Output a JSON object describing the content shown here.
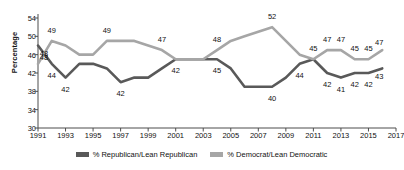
{
  "chart_data": {
    "type": "line",
    "title": "",
    "xlabel": "",
    "ylabel": "Percentage",
    "ylim": [
      30,
      54
    ],
    "yticks": [
      30,
      34,
      38,
      42,
      46,
      50,
      54
    ],
    "xlim": [
      1991,
      2017
    ],
    "xticks": [
      1991,
      1993,
      1995,
      1997,
      1999,
      2001,
      2003,
      2005,
      2007,
      2009,
      2011,
      2013,
      2015,
      2017
    ],
    "grid": false,
    "legend_position": "bottom",
    "x": [
      1991,
      1992,
      1993,
      1994,
      1995,
      1996,
      1997,
      1998,
      1999,
      2000,
      2001,
      2002,
      2003,
      2004,
      2005,
      2006,
      2007,
      2008,
      2009,
      2010,
      2011,
      2012,
      2013,
      2014,
      2015,
      2016
    ],
    "series": [
      {
        "name": "% Republican/Lean Republican",
        "color": "#595959",
        "values": [
          48,
          44,
          41,
          44,
          44,
          43,
          40,
          41,
          41,
          43,
          45,
          45,
          45,
          45,
          43,
          39,
          39,
          39,
          41,
          44,
          45,
          42,
          41,
          42,
          42,
          43
        ],
        "labels": [
          {
            "x": 1991,
            "value": 48,
            "text": "48"
          },
          {
            "x": 1992,
            "value": 44,
            "text": "44"
          },
          {
            "x": 1993,
            "value": 41,
            "text": "42"
          },
          {
            "x": 1997,
            "value": 40,
            "text": "42"
          },
          {
            "x": 2001,
            "value": 45,
            "text": "42"
          },
          {
            "x": 2004,
            "value": 45,
            "text": "45"
          },
          {
            "x": 2008,
            "value": 39,
            "text": "40"
          },
          {
            "x": 2010,
            "value": 44,
            "text": "44"
          },
          {
            "x": 2012,
            "value": 42,
            "text": "42"
          },
          {
            "x": 2013,
            "value": 41,
            "text": "41"
          },
          {
            "x": 2014,
            "value": 42,
            "text": "42"
          },
          {
            "x": 2015,
            "value": 42,
            "text": "42"
          },
          {
            "x": 2016,
            "value": 43,
            "text": "43"
          }
        ]
      },
      {
        "name": "% Democrat/Lean Democratic",
        "color": "#a6a6a6",
        "values": [
          44,
          49,
          48,
          46,
          46,
          49,
          49,
          49,
          48,
          47,
          45,
          45,
          45,
          47,
          49,
          50,
          51,
          52,
          49,
          46,
          45,
          47,
          47,
          45,
          45,
          47
        ],
        "labels": [
          {
            "x": 1991,
            "value": 44,
            "text": "48"
          },
          {
            "x": 1992,
            "value": 49,
            "text": "49"
          },
          {
            "x": 1996,
            "value": 49,
            "text": "49"
          },
          {
            "x": 2000,
            "value": 47,
            "text": "47"
          },
          {
            "x": 2004,
            "value": 47,
            "text": "48"
          },
          {
            "x": 2008,
            "value": 52,
            "text": "52"
          },
          {
            "x": 2011,
            "value": 45,
            "text": "45"
          },
          {
            "x": 2012,
            "value": 47,
            "text": "47"
          },
          {
            "x": 2013,
            "value": 47,
            "text": "47"
          },
          {
            "x": 2014,
            "value": 45,
            "text": "45"
          },
          {
            "x": 2015,
            "value": 45,
            "text": "45"
          },
          {
            "x": 2016,
            "value": 47,
            "text": "47"
          }
        ]
      }
    ]
  },
  "legend": {
    "items": [
      {
        "label": "% Republican/Lean Republican",
        "color": "#595959"
      },
      {
        "label": "% Democrat/Lean Democratic",
        "color": "#a6a6a6"
      }
    ]
  },
  "axis": {
    "y_title": "Percentage"
  }
}
